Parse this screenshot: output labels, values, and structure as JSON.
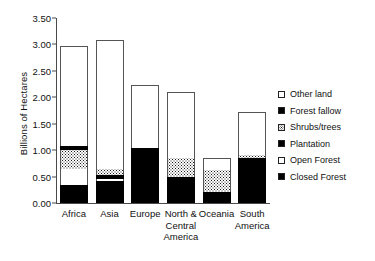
{
  "chart_data": {
    "type": "bar",
    "stacked": true,
    "title": "",
    "xlabel": "",
    "ylabel": "Billions of Hectares",
    "ylim": [
      0.0,
      3.5
    ],
    "ytick_labels": [
      "0.00",
      "0.50",
      "1.00",
      "1.50",
      "2.00",
      "2.50",
      "3.00",
      "3.50"
    ],
    "ytick_values": [
      0.0,
      0.5,
      1.0,
      1.5,
      2.0,
      2.5,
      3.0,
      3.5
    ],
    "grid": false,
    "legend_position": "right",
    "categories": [
      "Africa",
      "Asia",
      "Europe",
      "North & Central America",
      "Oceania",
      "South America"
    ],
    "category_lines": [
      [
        "Africa"
      ],
      [
        "Asia"
      ],
      [
        "Europe"
      ],
      [
        "North &",
        "Central",
        "America"
      ],
      [
        "Oceania"
      ],
      [
        "South",
        "America"
      ]
    ],
    "series": [
      {
        "name": "Closed Forest",
        "swatch": "solid",
        "values": [
          0.35,
          0.42,
          1.05,
          0.5,
          0.2,
          0.82
        ]
      },
      {
        "name": "Open Forest",
        "swatch": "empty",
        "values": [
          0.3,
          0.03,
          0.0,
          0.0,
          0.0,
          0.0
        ]
      },
      {
        "name": "Plantation",
        "swatch": "solid",
        "values": [
          0.0,
          0.08,
          0.0,
          0.0,
          0.0,
          0.03
        ]
      },
      {
        "name": "Shrubs/trees",
        "swatch": "dotted",
        "values": [
          0.35,
          0.12,
          0.0,
          0.35,
          0.42,
          0.05
        ]
      },
      {
        "name": "Forest fallow",
        "swatch": "solid",
        "values": [
          0.07,
          0.0,
          0.0,
          0.0,
          0.0,
          0.0
        ]
      },
      {
        "name": "Other land",
        "swatch": "empty",
        "values": [
          1.9,
          2.43,
          1.19,
          1.25,
          0.23,
          0.83
        ]
      }
    ],
    "totals": [
      2.97,
      3.08,
      2.24,
      2.1,
      0.85,
      1.73
    ],
    "legend": [
      {
        "label": "Other land",
        "swatch": "empty"
      },
      {
        "label": "Forest fallow",
        "swatch": "solid"
      },
      {
        "label": "Shrubs/trees",
        "swatch": "dotted"
      },
      {
        "label": "Plantation",
        "swatch": "solid"
      },
      {
        "label": "Open Forest",
        "swatch": "empty"
      },
      {
        "label": "Closed Forest",
        "swatch": "solid"
      }
    ],
    "colors": {
      "fill_dark": "#000000",
      "fill_light": "#ffffff",
      "outline": "#555555",
      "axis": "#4a4a4a"
    }
  }
}
